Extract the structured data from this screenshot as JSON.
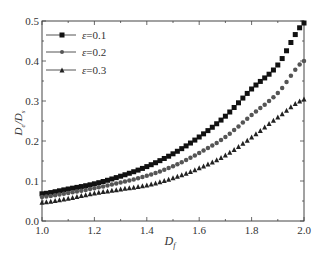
{
  "chart_data": {
    "type": "scatter",
    "title": "",
    "xlabel": "D_f",
    "ylabel": "D_e/D_s",
    "xlim": [
      1.0,
      2.0
    ],
    "ylim": [
      0.0,
      0.5
    ],
    "xticks": [
      "1.0",
      "1.2",
      "1.4",
      "1.6",
      "1.8",
      "2.0"
    ],
    "yticks": [
      "0.0",
      "0.1",
      "0.2",
      "0.3",
      "0.4",
      "0.5"
    ],
    "grid": false,
    "legend_position": "upper left",
    "x": [
      1.0,
      1.1,
      1.2,
      1.3,
      1.4,
      1.5,
      1.6,
      1.7,
      1.8,
      1.9,
      2.0
    ],
    "series": [
      {
        "name": "ε=0.1",
        "marker": "square",
        "color": "#111111",
        "values": [
          0.068,
          0.08,
          0.093,
          0.112,
          0.136,
          0.168,
          0.21,
          0.262,
          0.33,
          0.39,
          0.495
        ]
      },
      {
        "name": "ε=0.2",
        "marker": "circle",
        "color": "#555555",
        "values": [
          0.06,
          0.07,
          0.082,
          0.096,
          0.113,
          0.137,
          0.17,
          0.21,
          0.265,
          0.32,
          0.4
        ]
      },
      {
        "name": "ε=0.3",
        "marker": "triangle",
        "color": "#222222",
        "values": [
          0.047,
          0.057,
          0.07,
          0.08,
          0.09,
          0.108,
          0.133,
          0.165,
          0.21,
          0.26,
          0.305
        ]
      }
    ]
  },
  "labels": {
    "xlabel_main": "D",
    "xlabel_sub": "f",
    "ylabel_main1": "D",
    "ylabel_sub1": "e",
    "ylabel_sep": "/D",
    "ylabel_sub2": "s"
  }
}
